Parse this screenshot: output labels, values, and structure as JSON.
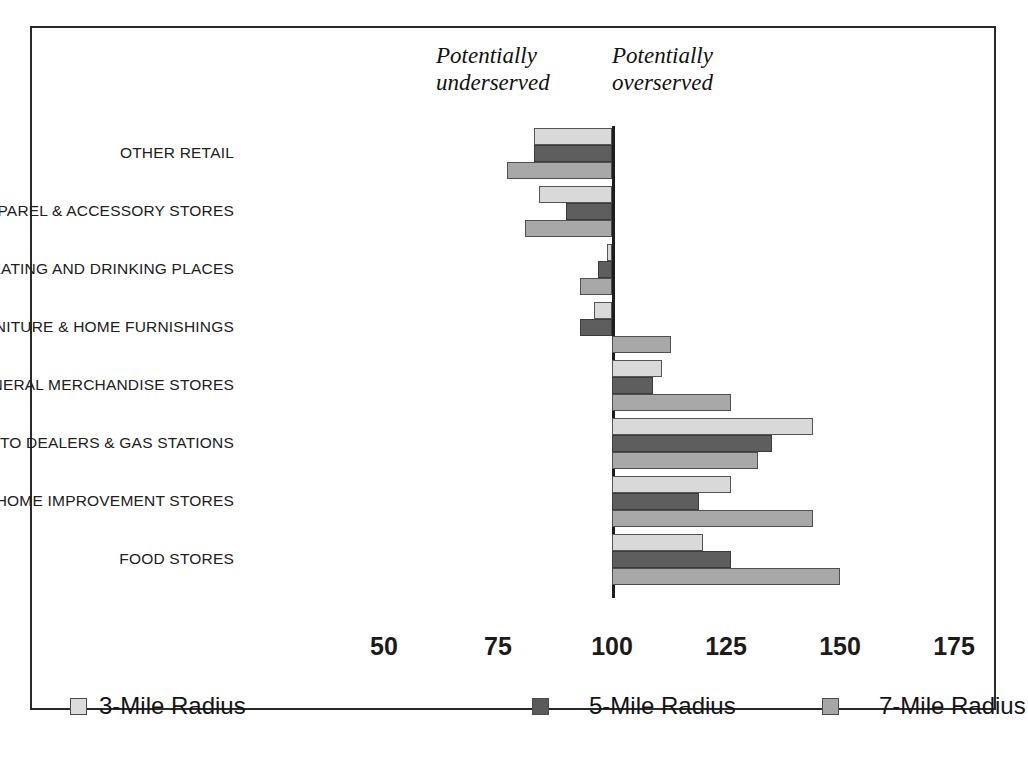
{
  "annotations": {
    "underserved": "Potentially\nunderserved",
    "overserved": "Potentially\noverserved"
  },
  "legend": {
    "items": [
      {
        "label": "3-Mile Radius",
        "color": "#dcdcdc",
        "swatch": "legend-swatch-3-mile"
      },
      {
        "label": "5-Mile Radius",
        "color": "#5a5a5a",
        "swatch": "legend-swatch-5-mile"
      },
      {
        "label": "7-Mile Radius",
        "color": "#a6a6a6",
        "swatch": "legend-swatch-7-mile"
      }
    ]
  },
  "chart_data": {
    "type": "bar",
    "orientation": "horizontal",
    "title": "",
    "xlabel": "",
    "ylabel": "",
    "baseline": 100,
    "xlim": [
      50,
      175
    ],
    "ticks": [
      50,
      75,
      100,
      125,
      150,
      175
    ],
    "grid": false,
    "legend_position": "bottom",
    "annotations": [
      "Potentially underserved",
      "Potentially overserved"
    ],
    "categories": [
      "OTHER RETAIL",
      "APPAREL & ACCESSORY STORES",
      "EATING AND DRINKING PLACES",
      "FURNITURE & HOME FURNISHINGS",
      "GENERAL MERCHANDISE STORES",
      "AUTO DEALERS & GAS STATIONS",
      "HOME IMPROVEMENT STORES",
      "FOOD STORES"
    ],
    "series": [
      {
        "name": "3-Mile Radius",
        "values": [
          83,
          84,
          99,
          96,
          111,
          144,
          126,
          120
        ]
      },
      {
        "name": "5-Mile Radius",
        "values": [
          83,
          90,
          97,
          93,
          109,
          135,
          119,
          126
        ]
      },
      {
        "name": "7-Mile Radius",
        "values": [
          77,
          81,
          93,
          113,
          126,
          132,
          144,
          150
        ]
      }
    ]
  }
}
